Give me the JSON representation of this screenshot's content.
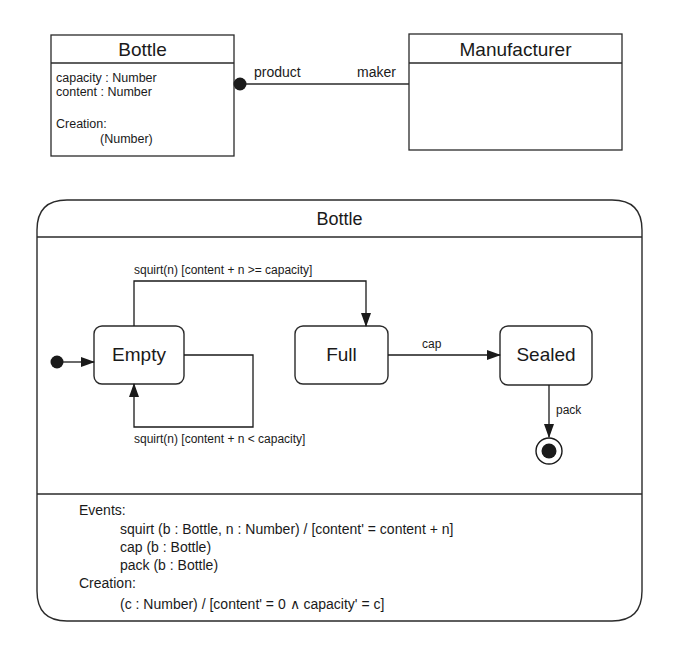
{
  "class_diagram": {
    "bottle_class": {
      "name": "Bottle",
      "attributes": [
        "capacity : Number",
        "content : Number"
      ],
      "creation_label": "Creation:",
      "creation_params": "(Number)"
    },
    "manufacturer_class": {
      "name": "Manufacturer"
    },
    "association": {
      "source_role": "product",
      "target_role": "maker"
    }
  },
  "state_machine": {
    "title": "Bottle",
    "states": [
      {
        "id": "empty",
        "label": "Empty"
      },
      {
        "id": "full",
        "label": "Full"
      },
      {
        "id": "sealed",
        "label": "Sealed"
      }
    ],
    "transitions": {
      "empty_to_full": "squirt(n) [content + n >= capacity]",
      "empty_self": "squirt(n) [content + n < capacity]",
      "full_to_sealed": "cap",
      "sealed_to_final": "pack"
    },
    "spec": {
      "events_label": "Events:",
      "events": [
        "squirt (b : Bottle, n : Number) / [content' = content + n]",
        "cap (b : Bottle)",
        "pack (b : Bottle)"
      ],
      "creation_label": "Creation:",
      "creation": "(c : Number) / [content' = 0 ∧ capacity' = c]"
    }
  }
}
